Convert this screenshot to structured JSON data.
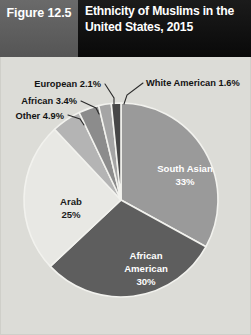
{
  "header": {
    "figure_number": "Figure 12.5",
    "title": "Ethnicity of Muslims in the United States, 2015"
  },
  "credit": {
    "text": "Source: Pew Research Center"
  },
  "colors": {
    "header_fignum_bg": "#5d5d5d",
    "header_title_bg": "#111111",
    "page_bg": "#dcdcd7",
    "slice_stroke": "#f2f2ee",
    "south_asian": "#9a9a9a",
    "african_american": "#5e5e5e",
    "arab": "#e8e8e4",
    "other": "#b4b4b4",
    "african": "#8c8c8c",
    "european": "#a5a5a5",
    "white_american": "#474747",
    "leader_line": "#2b2b2b",
    "callout_text": "#131313"
  },
  "chart_data": {
    "type": "pie",
    "title": "Ethnicity of Muslims in the United States, 2015",
    "subtitle": "",
    "xlabel": "",
    "ylabel": "",
    "units": "percent",
    "legend_position": "none",
    "grid": false,
    "start_angle_deg": 0,
    "direction": "clockwise",
    "categories": [
      "South Asian",
      "African American",
      "Arab",
      "Other",
      "African",
      "European",
      "White American"
    ],
    "values": [
      33,
      30,
      25,
      4.9,
      3.4,
      2.1,
      1.6
    ],
    "slices": [
      {
        "name": "South Asian",
        "value": 33,
        "value_label": "33%",
        "label": "South Asian",
        "color": "#9a9a9a",
        "label_placement": "inside",
        "label_color": "light"
      },
      {
        "name": "African American",
        "value": 30,
        "value_label": "30%",
        "label": "African American",
        "color": "#5e5e5e",
        "label_placement": "inside",
        "label_color": "light"
      },
      {
        "name": "Arab",
        "value": 25,
        "value_label": "25%",
        "label": "Arab",
        "color": "#e8e8e4",
        "label_placement": "inside",
        "label_color": "dark"
      },
      {
        "name": "Other",
        "value": 4.9,
        "value_label": "Other 4.9%",
        "label": "Other",
        "color": "#b4b4b4",
        "label_placement": "callout-left",
        "label_color": "dark"
      },
      {
        "name": "African",
        "value": 3.4,
        "value_label": "African 3.4%",
        "label": "African",
        "color": "#8c8c8c",
        "label_placement": "callout-left",
        "label_color": "dark"
      },
      {
        "name": "European",
        "value": 2.1,
        "value_label": "European 2.1%",
        "label": "European",
        "color": "#a5a5a5",
        "label_placement": "callout-left",
        "label_color": "dark"
      },
      {
        "name": "White American",
        "value": 1.6,
        "value_label": "White American 1.6%",
        "label": "White American",
        "color": "#474747",
        "label_placement": "callout-right",
        "label_color": "dark"
      }
    ]
  },
  "labels": {
    "south_asian_name": "South Asian",
    "south_asian_value": "33%",
    "african_american_name_line1": "African",
    "african_american_name_line2": "American",
    "african_american_value": "30%",
    "arab_name": "Arab",
    "arab_value": "25%",
    "other_callout": "Other 4.9%",
    "african_callout": "African 3.4%",
    "european_callout": "European 2.1%",
    "white_american_callout": "White American 1.6%"
  }
}
